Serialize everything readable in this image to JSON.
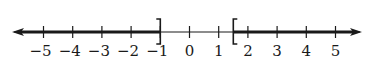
{
  "diagram": {
    "type": "number-line",
    "colors": {
      "line": "#1a1a1a",
      "background": "#ffffff"
    },
    "axis": {
      "min": -5,
      "max": 5,
      "ticks": [
        -5,
        -4,
        -3,
        -2,
        -1,
        0,
        1,
        2,
        3,
        4,
        5
      ],
      "tick_labels": [
        "−5",
        "−4",
        "−3",
        "−2",
        "−1",
        "0",
        "1",
        "2",
        "3",
        "4",
        "5"
      ],
      "arrows": [
        "left",
        "right"
      ]
    },
    "shaded_regions": [
      {
        "from": "-infinity",
        "to": -1,
        "end_bracket": "]",
        "inclusive": true
      },
      {
        "from": 1.5,
        "to": "infinity",
        "start_bracket": "[",
        "inclusive": true
      }
    ],
    "brackets": [
      {
        "value": -1,
        "glyph": "]"
      },
      {
        "value": 1.5,
        "glyph": "["
      }
    ]
  }
}
